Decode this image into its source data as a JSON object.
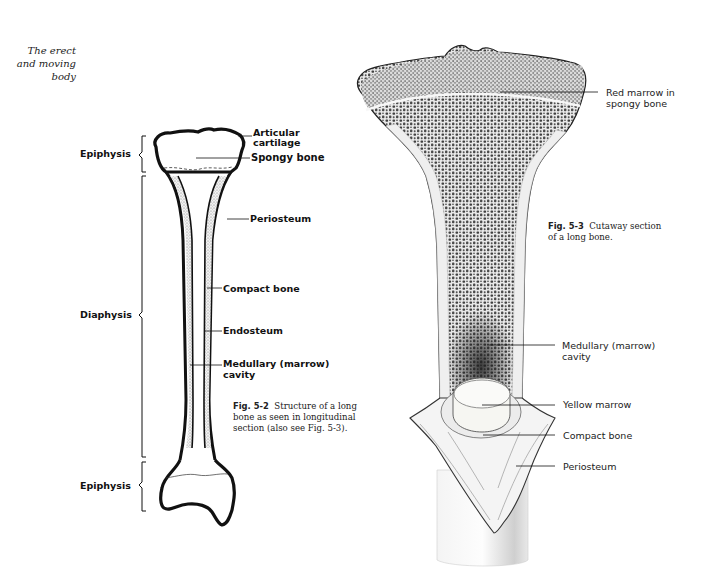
{
  "running_head": {
    "lines": [
      "The erect",
      "and moving",
      "body"
    ]
  },
  "figure_5_2": {
    "caption_label": "Fig. 5-2",
    "caption_text": "Structure of a long bone as seen in longitudinal section (also see Fig. 5-3).",
    "caption_lines": [
      "Structure of a long",
      "bone as seen in longitudinal",
      "section (also see Fig. 5-3)."
    ],
    "left_labels": {
      "top_epiphysis": "Epiphysis",
      "diaphysis": "Diaphysis",
      "bottom_epiphysis": "Epiphysis"
    },
    "right_labels": {
      "articular_cartilage": [
        "Articular",
        "cartilage"
      ],
      "spongy_bone": "Spongy bone",
      "periosteum": "Periosteum",
      "compact_bone": "Compact bone",
      "endosteum": "Endosteum",
      "medullary_cavity": [
        "Medullary (marrow)",
        "cavity"
      ]
    }
  },
  "figure_5_3": {
    "caption_label": "Fig. 5-3",
    "caption_lines": [
      "Cutaway section",
      "of a long bone."
    ],
    "labels": {
      "red_marrow": [
        "Red marrow in",
        "spongy bone"
      ],
      "medullary_cavity": [
        "Medullary (marrow)",
        "cavity"
      ],
      "yellow_marrow": "Yellow marrow",
      "compact_bone": "Compact bone",
      "periosteum": "Periosteum"
    }
  },
  "colors": {
    "ink": "#111111",
    "paper": "#ffffff",
    "stipple": "#8a8a8a",
    "spongy_dark": "#3a3a3a",
    "shaft_shade": "#d8d8d8"
  }
}
